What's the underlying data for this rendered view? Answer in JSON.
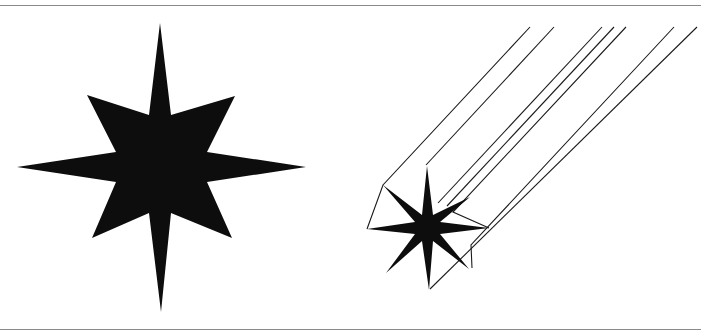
{
  "figure": {
    "colors": {
      "fill": "#0d0d0d",
      "line": "#1a1a1a",
      "rule": "#8a8a8a",
      "background": "#ffffff"
    },
    "large_star": {
      "cx": 160,
      "cy": 167,
      "long_ray": 145,
      "diag_ray": 100,
      "inner": 18
    },
    "shooting_star": {
      "cx": 427,
      "cy": 228,
      "long_ray": 62,
      "diag_ray": 48,
      "inner": 10,
      "trail_count": 7
    }
  }
}
